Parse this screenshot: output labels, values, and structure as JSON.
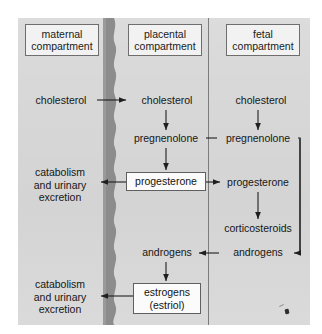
{
  "figure": {
    "panel_color": "#d8d8d8",
    "membrane_color": "#8c8c8c",
    "line_color": "#1f1f1f"
  },
  "headers": [
    {
      "id": "maternal",
      "label": "maternal\ncompartment"
    },
    {
      "id": "placental",
      "label": "placental\ncompartment"
    },
    {
      "id": "fetal",
      "label": "fetal\ncompartment"
    }
  ],
  "maternal": {
    "cholesterol": "cholesterol",
    "catabolism_upper": "catabolism\nand urinary\nexcretion",
    "catabolism_lower": "catabolism\nand urinary\nexcretion"
  },
  "placental": {
    "cholesterol": "cholesterol",
    "pregnenolone": "pregnenolone",
    "progesterone": "progesterone",
    "androgens": "androgens",
    "estrogens": "estrogens\n(estriol)"
  },
  "fetal": {
    "cholesterol": "cholesterol",
    "pregnenolone": "pregnenolone",
    "progesterone": "progesterone",
    "corticosteroids": "corticosteroids",
    "androgens": "androgens"
  },
  "boxed_items": [
    "maternal compartment",
    "placental compartment",
    "fetal compartment",
    "progesterone",
    "estrogens (estriol)"
  ],
  "flows": [
    {
      "from": "maternal cholesterol",
      "to": "placental cholesterol",
      "type": "arrow-right"
    },
    {
      "from": "placental cholesterol",
      "to": "placental pregnenolone",
      "type": "arrow-down"
    },
    {
      "from": "fetal cholesterol",
      "to": "fetal pregnenolone",
      "type": "arrow-down"
    },
    {
      "from": "placental pregnenolone",
      "to": "fetal pregnenolone",
      "type": "line"
    },
    {
      "from": "placental pregnenolone",
      "to": "placental progesterone",
      "type": "arrow-down"
    },
    {
      "from": "placental progesterone",
      "to": "maternal catabolism",
      "type": "arrow-left"
    },
    {
      "from": "placental progesterone",
      "to": "fetal progesterone",
      "type": "arrow-right"
    },
    {
      "from": "fetal progesterone",
      "to": "fetal corticosteroids",
      "type": "arrow-down"
    },
    {
      "from": "fetal pregnenolone",
      "to": "fetal androgens",
      "type": "routed-arrow-left"
    },
    {
      "from": "fetal androgens",
      "to": "placental androgens",
      "type": "arrow-left"
    },
    {
      "from": "placental androgens",
      "to": "placental estrogens",
      "type": "arrow-down"
    },
    {
      "from": "placental estrogens",
      "to": "maternal catabolism",
      "type": "arrow-left"
    }
  ]
}
